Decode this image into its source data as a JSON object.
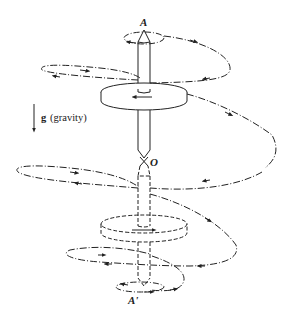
{
  "diagram": {
    "labels": {
      "top_tip": "A",
      "pivot": "O",
      "bottom_tip": "A'",
      "gravity_symbol": "g",
      "gravity_text": "(gravity)"
    },
    "icons": {
      "gravity_arrow": "down-arrow-icon"
    },
    "colors": {
      "ink": "#222222",
      "background": "#ffffff"
    }
  }
}
